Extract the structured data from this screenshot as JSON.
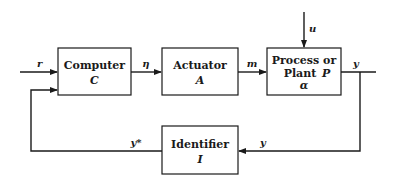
{
  "diagram": {
    "type": "block-diagram",
    "blocks": {
      "computer": {
        "label": "Computer",
        "symbol": "C"
      },
      "actuator": {
        "label": "Actuator",
        "symbol": "A"
      },
      "plant": {
        "label_line1": "Process or",
        "label_line2": "Plant",
        "symbol": "P",
        "param": "α"
      },
      "identifier": {
        "label": "Identifier",
        "symbol": "I"
      }
    },
    "signals": {
      "reference": "r",
      "control": "η",
      "actuation": "m",
      "disturbance": "u",
      "output": "y",
      "feedback_in": "y",
      "estimate": "y*"
    }
  }
}
